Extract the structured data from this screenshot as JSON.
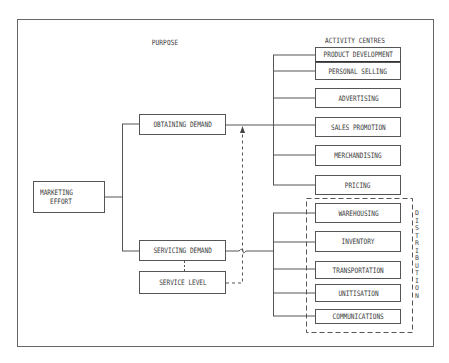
{
  "diagram": {
    "labels": {
      "purpose": "PURPOSE",
      "activity_centres": "ACTIVITY CENTRES",
      "distribution": "DISTRIBUTION"
    },
    "root": {
      "line1": "MARKETING",
      "line2": "EFFORT"
    },
    "purposes": [
      {
        "id": "obtaining",
        "label": "OBTAINING DEMAND"
      },
      {
        "id": "servicing",
        "label": "SERVICING DEMAND"
      },
      {
        "id": "service_level",
        "label": "SERVICE LEVEL"
      }
    ],
    "demand_activities": [
      {
        "label": "PRODUCT DEVELOPMENT"
      },
      {
        "label": "PERSONAL SELLING"
      },
      {
        "label": "ADVERTISING"
      },
      {
        "label": "SALES PROMOTION"
      },
      {
        "label": "MERCHANDISING"
      },
      {
        "label": "PRICING"
      }
    ],
    "distribution_activities": [
      {
        "label": "WAREHOUSING"
      },
      {
        "label": "INVENTORY"
      },
      {
        "label": "TRANSPORTATION"
      },
      {
        "label": "UNITISATION"
      },
      {
        "label": "COMMUNICATIONS"
      }
    ],
    "colors": {
      "line": "#555555",
      "text": "#3a3a3a",
      "background": "#ffffff"
    }
  }
}
